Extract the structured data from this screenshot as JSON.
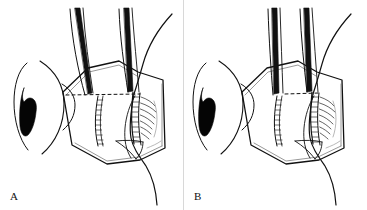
{
  "figure": {
    "width": 367,
    "height": 210,
    "background_color": "#ffffff",
    "ink_color": "#111111",
    "style": "black-and-white pen-and-ink medical line art",
    "panel_count": 2
  },
  "panels": [
    {
      "id": "a",
      "label": "A",
      "label_position": "bottom-left",
      "description": "Eye globe in profile at left with dark pupil; trapezoidal tissue flap held open by two forceps; horizontal dashed incision line spans the full flap; two vertical stitched seams; long curved suture thread exits lower right.",
      "elements": {
        "globe_label": "eye-globe",
        "pupil_label": "pupil",
        "flap_label": "tissue-flap",
        "dashed_line_label": "incision-dashed-line",
        "dashed_line_extent": "full-width",
        "forceps_count": 2,
        "forceps_orientation": "angled-inward",
        "seam_count": 2,
        "suture_label": "suture-thread",
        "suture_path": "enters top-right, passes through flap, exits bottom-right"
      }
    },
    {
      "id": "b",
      "label": "B",
      "label_position": "bottom-left",
      "description": "Same eye and flap; forceps are near-vertical and closer together; dashed line is shortened to the right half only; two vertical stitched seams with hatching; curved suture thread exits lower right.",
      "elements": {
        "globe_label": "eye-globe",
        "pupil_label": "pupil",
        "flap_label": "tissue-flap",
        "dashed_line_label": "incision-dashed-line",
        "dashed_line_extent": "right-half",
        "forceps_count": 2,
        "forceps_orientation": "near-vertical",
        "seam_count": 2,
        "suture_label": "suture-thread",
        "suture_path": "enters top-right, passes through flap, exits bottom-right"
      }
    }
  ],
  "colors": {
    "ink": "#111111",
    "paper": "#ffffff",
    "divider": "#d8d8d8",
    "shadow_gray": "#8a8a8a"
  }
}
